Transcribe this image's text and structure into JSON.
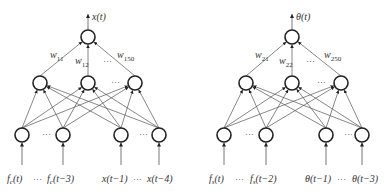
{
  "diagrams": [
    {
      "name": "x-network",
      "output_label": "x(t)",
      "output_node": {
        "x": 88,
        "y": 37
      },
      "hidden_nodes": [
        {
          "x": 40,
          "y": 83
        },
        {
          "x": 88,
          "y": 83
        },
        {
          "x": 135,
          "y": 83
        }
      ],
      "input_nodes": [
        {
          "x": 22,
          "y": 135
        },
        {
          "x": 63,
          "y": 135
        },
        {
          "x": 121,
          "y": 135
        },
        {
          "x": 159,
          "y": 135
        }
      ],
      "weights": [
        {
          "base": "w",
          "sub": "11",
          "x": 50,
          "y": 58
        },
        {
          "base": "w",
          "sub": "12",
          "x": 75,
          "y": 64
        },
        {
          "base": "w",
          "sub": "150",
          "x": 117,
          "y": 58
        }
      ],
      "weight_ellipsis": {
        "text": "···",
        "x": 103,
        "y": 64
      },
      "hidden_ellipsis": {
        "text": "···",
        "x": 111,
        "y": 85
      },
      "input_ellipsis_left": {
        "text": "···",
        "x": 42,
        "y": 137
      },
      "input_ellipsis_right": {
        "text": "···",
        "x": 139,
        "y": 137
      },
      "inputs": [
        {
          "main": "f",
          "sub": "c",
          "tail": "(t)",
          "x": 7
        },
        {
          "main": "f",
          "sub": "c",
          "tail": "(t−3)",
          "x": 47
        },
        {
          "main": "x(t−1)",
          "sub": "",
          "tail": "",
          "x": 102
        },
        {
          "main": "x(t−4)",
          "sub": "",
          "tail": "",
          "x": 147
        }
      ],
      "bottom_ellipsis_1": {
        "text": "···",
        "x": 33
      },
      "bottom_ellipsis_2": {
        "text": "···",
        "x": 133
      }
    },
    {
      "name": "theta-network",
      "output_label": "θ(t)",
      "output_node": {
        "x": 292,
        "y": 37
      },
      "hidden_nodes": [
        {
          "x": 246,
          "y": 83
        },
        {
          "x": 292,
          "y": 83
        },
        {
          "x": 341,
          "y": 83
        }
      ],
      "input_nodes": [
        {
          "x": 224,
          "y": 135
        },
        {
          "x": 266,
          "y": 135
        },
        {
          "x": 326,
          "y": 135
        },
        {
          "x": 362,
          "y": 135
        }
      ],
      "weights": [
        {
          "base": "w",
          "sub": "21",
          "x": 255,
          "y": 58
        },
        {
          "base": "w",
          "sub": "22",
          "x": 279,
          "y": 64
        },
        {
          "base": "w",
          "sub": "250",
          "x": 324,
          "y": 58
        }
      ],
      "weight_ellipsis": {
        "text": "···",
        "x": 306,
        "y": 64
      },
      "hidden_ellipsis": {
        "text": "···",
        "x": 317,
        "y": 85
      },
      "input_ellipsis_left": {
        "text": "···",
        "x": 245,
        "y": 137
      },
      "input_ellipsis_right": {
        "text": "···",
        "x": 344,
        "y": 137
      },
      "inputs": [
        {
          "main": "f",
          "sub": "s",
          "tail": "(t)",
          "x": 209
        },
        {
          "main": "f",
          "sub": "s",
          "tail": "(t−2)",
          "x": 250
        },
        {
          "main": "θ(t−1)",
          "sub": "",
          "tail": "",
          "x": 305
        },
        {
          "main": "θ(t−3)",
          "sub": "",
          "tail": "",
          "x": 352
        }
      ],
      "bottom_ellipsis_1": {
        "text": "···",
        "x": 235
      },
      "bottom_ellipsis_2": {
        "text": "···",
        "x": 337
      }
    }
  ],
  "colors": {
    "node_stroke": "#222222",
    "edge": "#555555",
    "text": "#333333",
    "background": "#ffffff"
  }
}
